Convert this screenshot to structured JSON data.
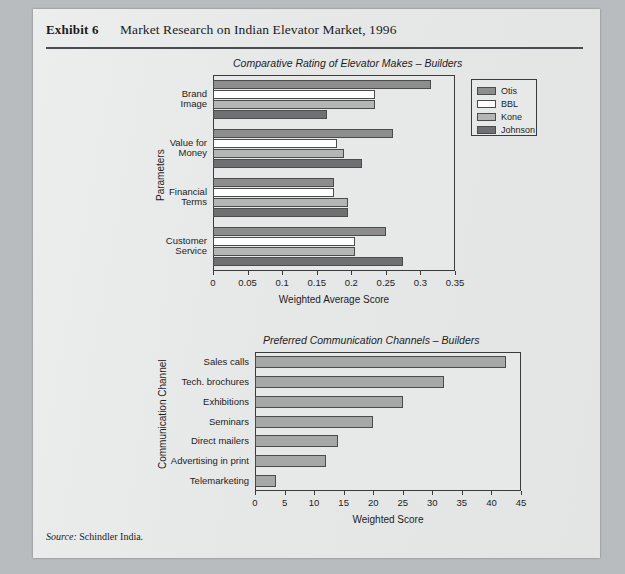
{
  "exhibit": {
    "label": "Exhibit 6",
    "title": "Market Research on Indian Elevator Market, 1996"
  },
  "source": {
    "prefix": "Source:",
    "text": "Schindler India."
  },
  "legend": {
    "items": [
      {
        "label": "Otis",
        "color": "#8d8d8d"
      },
      {
        "label": "BBL",
        "color": "#ffffff"
      },
      {
        "label": "Kone",
        "color": "#b4b5b5"
      },
      {
        "label": "Johnson",
        "color": "#6f7071"
      }
    ]
  },
  "chart_data": [
    {
      "type": "bar",
      "orientation": "horizontal",
      "title": "Comparative Rating of Elevator Makes – Builders",
      "xlabel": "Weighted Average Score",
      "ylabel": "Parameters",
      "xlim": [
        0,
        0.35
      ],
      "xticks": [
        "0",
        "0.05",
        "0.1",
        "0.15",
        "0.2",
        "0.25",
        "0.3",
        "0.35"
      ],
      "xtick_values": [
        0,
        0.05,
        0.1,
        0.15,
        0.2,
        0.25,
        0.3,
        0.35
      ],
      "grid": false,
      "legend_position": "right",
      "categories": [
        "Brand Image",
        "Value for Money",
        "Financial Terms",
        "Customer Service"
      ],
      "category_lines": [
        [
          "Brand",
          "Image"
        ],
        [
          "Value for",
          "Money"
        ],
        [
          "Financial",
          "Terms"
        ],
        [
          "Customer",
          "Service"
        ]
      ],
      "series": [
        {
          "name": "Otis",
          "color": "#8d8d8d",
          "values": [
            0.315,
            0.26,
            0.175,
            0.25
          ]
        },
        {
          "name": "BBL",
          "color": "#ffffff",
          "values": [
            0.235,
            0.18,
            0.175,
            0.205
          ]
        },
        {
          "name": "Kone",
          "color": "#b4b5b5",
          "values": [
            0.235,
            0.19,
            0.195,
            0.205
          ]
        },
        {
          "name": "Johnson",
          "color": "#6f7071",
          "values": [
            0.165,
            0.215,
            0.195,
            0.275
          ]
        }
      ]
    },
    {
      "type": "bar",
      "orientation": "horizontal",
      "title": "Preferred Communication Channels – Builders",
      "xlabel": "Weighted Score",
      "ylabel": "Communication Channel",
      "xlim": [
        0,
        45
      ],
      "xticks": [
        "0",
        "5",
        "10",
        "15",
        "20",
        "25",
        "30",
        "35",
        "40",
        "45"
      ],
      "xtick_values": [
        0,
        5,
        10,
        15,
        20,
        25,
        30,
        35,
        40,
        45
      ],
      "grid": false,
      "legend_position": "none",
      "bar_color": "#a6a7a7",
      "categories": [
        "Sales calls",
        "Tech. brochures",
        "Exhibitions",
        "Seminars",
        "Direct mailers",
        "Advertising in print",
        "Telemarketing"
      ],
      "values": [
        42.5,
        32.0,
        25.0,
        20.0,
        14.0,
        12.0,
        3.5
      ]
    }
  ]
}
